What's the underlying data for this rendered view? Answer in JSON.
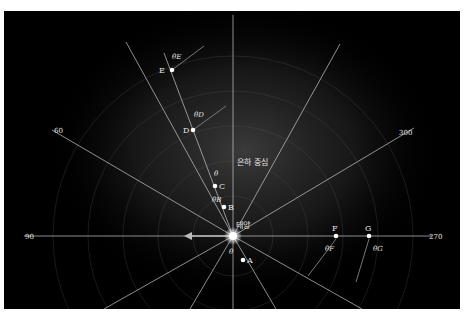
{
  "diagram": {
    "title": "",
    "labels": {
      "galactic_center": "은하 중심",
      "sun": "태양"
    },
    "longitude_labels": [
      {
        "id": "l90",
        "text": "90"
      },
      {
        "id": "l60",
        "text": "60"
      },
      {
        "id": "l300",
        "text": "300"
      },
      {
        "id": "l270",
        "text": "270"
      }
    ],
    "points": [
      {
        "id": "A",
        "label": "A"
      },
      {
        "id": "B",
        "label": "B"
      },
      {
        "id": "C",
        "label": "C"
      },
      {
        "id": "D",
        "label": "D"
      },
      {
        "id": "E",
        "label": "E"
      },
      {
        "id": "F",
        "label": "F"
      },
      {
        "id": "G",
        "label": "G"
      }
    ],
    "angle_labels": [
      {
        "id": "theta_A",
        "text": "θ"
      },
      {
        "id": "theta_B",
        "text": "θB"
      },
      {
        "id": "theta_C",
        "text": "θ"
      },
      {
        "id": "theta_D",
        "text": "θD"
      },
      {
        "id": "theta_E",
        "text": "θE"
      },
      {
        "id": "theta_F",
        "text": "θF"
      },
      {
        "id": "theta_G",
        "text": "θG"
      }
    ],
    "colors": {
      "background": "#000000",
      "lines": "#cfcfcf",
      "points": "#ffffff",
      "text": "#e6e6e6",
      "frame": "#ffffff"
    }
  }
}
